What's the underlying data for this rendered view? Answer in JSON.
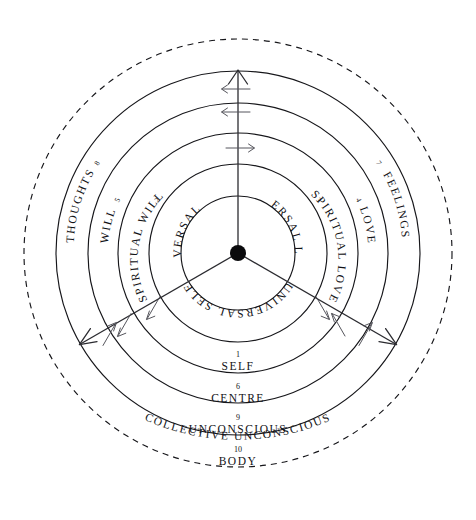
{
  "diagram": {
    "center_dot_name": "centre-point",
    "colors": {
      "ink": "#16161a",
      "axis": "#2b2b30",
      "tick": "#55555c",
      "background": "#ffffff"
    },
    "geometry": {
      "center_x": 238,
      "center_y": 253,
      "ring_radii": [
        57,
        89,
        120,
        150,
        182
      ],
      "dashed_radius": 214
    },
    "inner_sectors": [
      {
        "id": "universal-will",
        "label": "UNIVERSAL WILL"
      },
      {
        "id": "universal-love",
        "label": "UNIVERSAL LOVE"
      },
      {
        "id": "universal-self",
        "label": "UNIVERSAL SELF"
      }
    ],
    "left_band_labels": [
      {
        "id": "spiritual-will",
        "number": "2",
        "label": "SPIRITUAL WILL"
      },
      {
        "id": "will",
        "number": "5",
        "label": "WILL"
      },
      {
        "id": "thoughts",
        "number": "8",
        "label": "THOUGHTS"
      }
    ],
    "right_band_labels": [
      {
        "id": "spiritual-love",
        "number": "3",
        "label": "SPIRITUAL LOVE"
      },
      {
        "id": "love",
        "number": "4",
        "label": "LOVE"
      },
      {
        "id": "feelings",
        "number": "7",
        "label": "FEELINGS"
      }
    ],
    "bottom_band_labels": [
      {
        "id": "self",
        "number": "1",
        "label": "SELF"
      },
      {
        "id": "centre",
        "number": "6",
        "label": "CENTRE"
      },
      {
        "id": "unconscious",
        "number": "9",
        "label": "UNCONSCIOUS"
      },
      {
        "id": "body",
        "number": "10",
        "label": "BODY"
      }
    ],
    "outer_label": {
      "id": "collective-unconscious",
      "label": "COLLECTIVE UNCONSCIOUS"
    },
    "axes": [
      {
        "id": "will-axis",
        "angle_deg": 270,
        "arrowhead": "outward"
      },
      {
        "id": "love-axis",
        "angle_deg": 30,
        "arrowhead": "outward"
      },
      {
        "id": "self-axis",
        "angle_deg": 150,
        "arrowhead": "outward"
      }
    ]
  }
}
